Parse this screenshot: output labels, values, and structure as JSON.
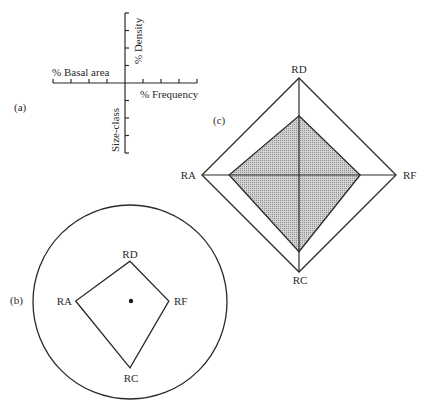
{
  "panel_a": {
    "tag": "(a)",
    "axes": {
      "left": "% Basal area",
      "right": "% Frequency",
      "up": "% Density",
      "down": "Size-class"
    },
    "ticks_per_half_axis": 4
  },
  "panel_b": {
    "tag": "(b)",
    "vertices": {
      "top": "RD",
      "right": "RF",
      "bottom": "RC",
      "left": "RA"
    },
    "relative_extent": {
      "RD": 0.41,
      "RF": 0.4,
      "RC": 0.69,
      "RA": 0.56
    },
    "center_marker": "dot"
  },
  "panel_c": {
    "tag": "(c)",
    "vertices": {
      "top": "RD",
      "right": "RF",
      "bottom": "RC",
      "left": "RA"
    },
    "outer_extent": 1.0,
    "inner_relative_extent": {
      "RD": 0.61,
      "RF": 0.63,
      "RC": 0.79,
      "RA": 0.72
    },
    "inner_fill": "#bdbdbd",
    "inner_fill_pattern": "crosshatch"
  }
}
